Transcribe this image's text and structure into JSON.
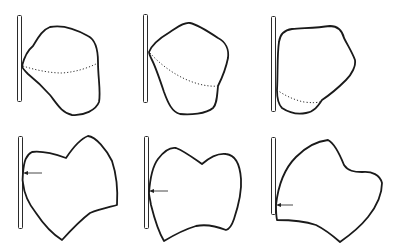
{
  "figure": {
    "layout": {
      "rows": 2,
      "columns": 3
    },
    "colors": {
      "line": "#1a1a1a",
      "background": "#ffffff"
    },
    "panels": [
      {
        "row": 1,
        "column": 1,
        "marker": "dotted-line",
        "description": "blob shape touching vertical bar with dotted contact line"
      },
      {
        "row": 1,
        "column": 2,
        "marker": "dotted-line",
        "description": "blob shape touching vertical bar with dotted contact line"
      },
      {
        "row": 1,
        "column": 3,
        "marker": "dotted-line",
        "description": "blob shape touching vertical bar with dotted contact line near bottom"
      },
      {
        "row": 2,
        "column": 1,
        "marker": "arrow",
        "description": "heart-like shape touching vertical bar with arrow pointing to contact"
      },
      {
        "row": 2,
        "column": 2,
        "marker": "arrow",
        "description": "notched shape touching vertical bar with arrow pointing to contact"
      },
      {
        "row": 2,
        "column": 3,
        "marker": "arrow",
        "description": "notched shape touching vertical bar with arrow pointing to contact near bottom"
      }
    ]
  }
}
